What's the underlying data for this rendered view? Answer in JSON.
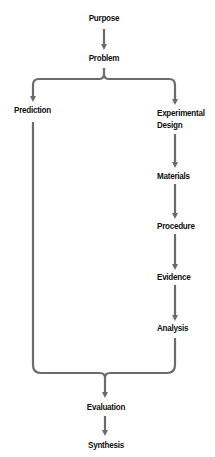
{
  "diagram": {
    "colors": {
      "arrow": "#6b6b6b",
      "text": "#111111",
      "background": "#ffffff"
    },
    "nodes": {
      "purpose": "Purpose",
      "problem": "Problem",
      "prediction": "Prediction",
      "experimental_design_line1": "Experimental",
      "experimental_design_line2": "Design",
      "materials": "Materials",
      "procedure": "Procedure",
      "evidence": "Evidence",
      "analysis": "Analysis",
      "evaluation": "Evaluation",
      "synthesis": "Synthesis"
    },
    "edges": [
      {
        "from": "Purpose",
        "to": "Problem"
      },
      {
        "from": "Problem",
        "to": "Prediction",
        "type": "branch"
      },
      {
        "from": "Problem",
        "to": "Experimental Design",
        "type": "branch"
      },
      {
        "from": "Experimental Design",
        "to": "Materials"
      },
      {
        "from": "Materials",
        "to": "Procedure"
      },
      {
        "from": "Procedure",
        "to": "Evidence"
      },
      {
        "from": "Evidence",
        "to": "Analysis"
      },
      {
        "from": "Prediction",
        "to": "Evaluation",
        "type": "merge"
      },
      {
        "from": "Analysis",
        "to": "Evaluation",
        "type": "merge"
      },
      {
        "from": "Evaluation",
        "to": "Synthesis"
      }
    ]
  }
}
